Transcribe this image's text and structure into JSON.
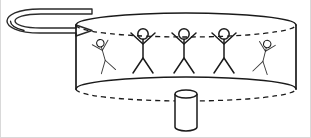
{
  "diagram": {
    "title": "Rotating drum with riders",
    "caption": "",
    "background_color": "#ffffff",
    "ink_color": "#1a1a1a",
    "arrow_shade_color": "#9a9a9a",
    "canvas": {
      "width": 311,
      "height": 138
    },
    "rotation_arrow": {
      "label": "rotation-direction-arrow",
      "description": "flattened looping arrow curling counter-clockwise around the drum axis, arrowhead pointing right",
      "head_x": 92,
      "head_y": 31,
      "tail_x": 92,
      "tail_y": 12
    },
    "drum": {
      "label": "rotating drum",
      "top_rim": {
        "center_x": 186,
        "center_y": 25,
        "radius_x": 110,
        "radius_y": 12,
        "back_arc_style": "solid",
        "front_arc_style": "dashed"
      },
      "bottom_rim": {
        "center_x": 186,
        "center_y": 89,
        "radius_x": 110,
        "radius_y": 12,
        "back_arc_style": "solid",
        "front_arc_style": "dashed"
      },
      "wall_left_x": 76,
      "wall_right_x": 296,
      "wall_top_y": 25,
      "wall_bottom_y": 89
    },
    "center_post": {
      "label": "central post",
      "x": 175,
      "y": 90,
      "width": 22,
      "height": 37,
      "cap_radius_y": 4
    },
    "riders": [
      {
        "id": "rider-1",
        "x": 104,
        "y": 56,
        "scale": 0.74,
        "tilt": -16,
        "pose": "arms-up",
        "foreshortened": true
      },
      {
        "id": "rider-2",
        "x": 143,
        "y": 52,
        "scale": 1.0,
        "tilt": 0,
        "pose": "arms-up",
        "foreshortened": false
      },
      {
        "id": "rider-3",
        "x": 184,
        "y": 52,
        "scale": 1.0,
        "tilt": 0,
        "pose": "arms-up",
        "foreshortened": false
      },
      {
        "id": "rider-4",
        "x": 224,
        "y": 52,
        "scale": 1.0,
        "tilt": 0,
        "pose": "arms-up",
        "foreshortened": false
      },
      {
        "id": "rider-5",
        "x": 264,
        "y": 57,
        "scale": 0.74,
        "tilt": 14,
        "pose": "arms-up",
        "foreshortened": true
      }
    ]
  }
}
